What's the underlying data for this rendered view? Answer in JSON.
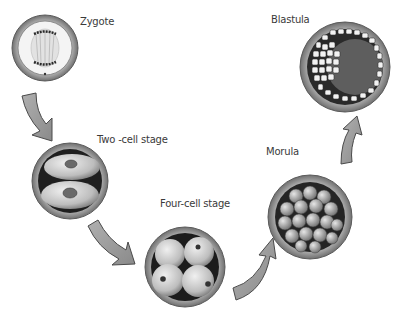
{
  "diagram": {
    "stages": [
      {
        "id": "zygote",
        "label": "Zygote",
        "cx": 45,
        "cy": 48,
        "r": 33,
        "label_x": 80,
        "label_y": 16
      },
      {
        "id": "two-cell",
        "label": "Two -cell stage",
        "cx": 70,
        "cy": 181,
        "r": 38,
        "label_x": 97,
        "label_y": 134
      },
      {
        "id": "four-cell",
        "label": "Four-cell stage",
        "cx": 185,
        "cy": 267,
        "r": 40,
        "label_x": 160,
        "label_y": 198
      },
      {
        "id": "morula",
        "label": "Morula",
        "cx": 310,
        "cy": 217,
        "r": 42,
        "label_x": 266,
        "label_y": 146
      },
      {
        "id": "blastula",
        "label": "Blastula",
        "cx": 345,
        "cy": 67,
        "r": 45,
        "label_x": 271,
        "label_y": 14
      }
    ],
    "arrows": [
      {
        "from": "zygote",
        "to": "two-cell"
      },
      {
        "from": "two-cell",
        "to": "four-cell"
      },
      {
        "from": "four-cell",
        "to": "morula"
      },
      {
        "from": "morula",
        "to": "blastula"
      }
    ],
    "colors": {
      "arrow_fill": "#9a9a9a",
      "arrow_stroke": "#4a4a4a",
      "membrane": "#8a8a8a",
      "cell_dark": "#2e2e2e",
      "cell_light": "#d9d9d9",
      "label": "#3a3a3a"
    }
  }
}
